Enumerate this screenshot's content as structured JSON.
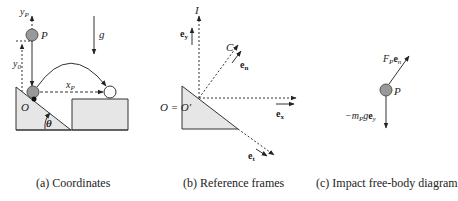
{
  "panels": [
    {
      "id": "a",
      "caption": "(a) Coordinates",
      "labels": {
        "yP": "y",
        "yP_sub": "P",
        "P": "P",
        "g": "g",
        "y0": "y",
        "y0_sub": "0",
        "xP": "x",
        "xP_sub": "P",
        "O": "O",
        "theta": "θ"
      }
    },
    {
      "id": "b",
      "caption": "(b) Reference frames",
      "labels": {
        "I": "I",
        "ey": "e",
        "ey_sub": "y",
        "C": "C",
        "en": "e",
        "en_sub": "n",
        "origin": "O = O′",
        "ex": "e",
        "ex_sub": "x",
        "et": "e",
        "et_sub": "t"
      }
    },
    {
      "id": "c",
      "caption": "(c) Impact free-body diagram",
      "labels": {
        "force": "F",
        "force_sub": "P",
        "force_vec": "e",
        "force_vec_sub": "n",
        "P": "P",
        "weight_prefix": "−m",
        "weight_sub": "P",
        "weight_g": "g",
        "weight_vec": "e",
        "weight_vec_sub": "y"
      }
    }
  ],
  "colors": {
    "particle_fill": "#999999",
    "ground_fill": "#e6e6e6",
    "line": "#333333"
  }
}
